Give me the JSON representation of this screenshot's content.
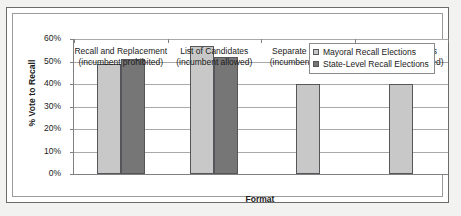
{
  "chart_data": {
    "type": "bar",
    "title": "",
    "xlabel": "Format",
    "ylabel": "% Vote to Recall",
    "ylim": [
      0,
      60
    ],
    "ytick_labels": [
      "0%",
      "10%",
      "20%",
      "30%",
      "40%",
      "50%",
      "60%"
    ],
    "ytick_values": [
      0,
      10,
      20,
      30,
      40,
      50,
      60
    ],
    "grid": true,
    "legend_position": "upper right",
    "categories": [
      "Recall and Replacement (incumbent prohibited)",
      "List of Candidates (incumbent allowed)",
      "Separate Elections (incumbent allowed)",
      "Separate Elections (incumbent prohibited)"
    ],
    "category_lines": [
      {
        "line1": "Recall and Replacement",
        "line2": "(incumbent prohibited)"
      },
      {
        "line1": "List of Candidates",
        "line2": "(incumbent allowed)"
      },
      {
        "line1": "Separate Elections",
        "line2": "(incumbent allowed)"
      },
      {
        "line1": "Separate Elections",
        "line2": "(incumbent prohibited)"
      }
    ],
    "series": [
      {
        "name": "Mayoral Recall Elections",
        "color": "#c8c8c8",
        "values": [
          49,
          57,
          40,
          40
        ]
      },
      {
        "name": "State-Level Recall Elections",
        "color": "#767676",
        "values": [
          51,
          52,
          null,
          null
        ]
      }
    ]
  }
}
